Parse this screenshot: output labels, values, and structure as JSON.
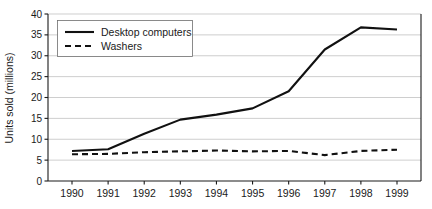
{
  "chart_data": {
    "type": "line",
    "title": "",
    "xlabel": "",
    "ylabel": "Units sold (millions)",
    "categories": [
      "1990",
      "1991",
      "1992",
      "1993",
      "1994",
      "1995",
      "1996",
      "1997",
      "1998",
      "1999"
    ],
    "x": [
      1990,
      1991,
      1992,
      1993,
      1994,
      1995,
      1996,
      1997,
      1998,
      1999
    ],
    "series": [
      {
        "name": "Desktop computers",
        "style": "solid",
        "color": "#111111",
        "values": [
          7.2,
          7.6,
          11.3,
          14.7,
          15.9,
          17.4,
          21.5,
          31.5,
          36.8,
          36.3
        ]
      },
      {
        "name": "Washers",
        "style": "dashed",
        "color": "#111111",
        "values": [
          6.4,
          6.5,
          6.9,
          7.1,
          7.3,
          7.1,
          7.2,
          6.2,
          7.2,
          7.5
        ]
      }
    ],
    "ylim": [
      0,
      40
    ],
    "y_ticks": [
      0,
      5,
      10,
      15,
      20,
      25,
      30,
      35,
      40
    ],
    "y_tick_labels": [
      "0",
      "5",
      "10",
      "15",
      "20",
      "25",
      "30",
      "35",
      "40"
    ],
    "grid": true,
    "grid_axis": "y",
    "legend_position": "top-left",
    "legend": [
      {
        "label": "Desktop computers",
        "style": "solid"
      },
      {
        "label": "Washers",
        "style": "dashed"
      }
    ]
  }
}
